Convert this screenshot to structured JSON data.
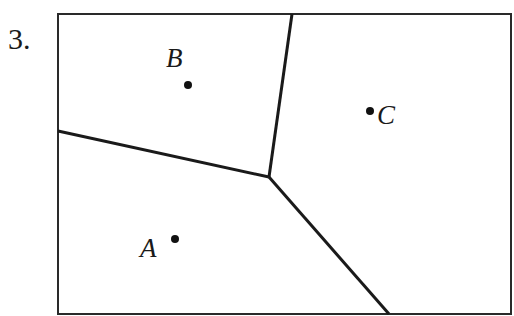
{
  "problem": {
    "number": "3."
  },
  "diagram": {
    "type": "voronoi",
    "frame": {
      "x1": 58,
      "y1": 14,
      "x2": 511,
      "y2": 314
    },
    "junction": {
      "x": 269,
      "y": 177
    },
    "boundaries": [
      {
        "from": "junction",
        "to": {
          "x": 292,
          "y": 14
        }
      },
      {
        "from": "junction",
        "to": {
          "x": 58,
          "y": 131
        }
      },
      {
        "from": "junction",
        "to": {
          "x": 389,
          "y": 314
        }
      }
    ],
    "points": [
      {
        "label": "A",
        "x": 175,
        "y": 239,
        "label_x": 140,
        "label_y": 256
      },
      {
        "label": "B",
        "x": 188,
        "y": 85,
        "label_x": 167,
        "label_y": 67
      },
      {
        "label": "C",
        "x": 370,
        "y": 111,
        "label_x": 377,
        "label_y": 123
      }
    ],
    "colors": {
      "line": "#1a1a1a",
      "background": "#ffffff"
    }
  }
}
